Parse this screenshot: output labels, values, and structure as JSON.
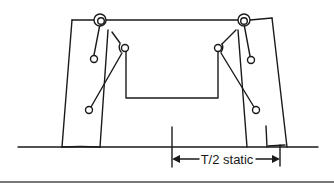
{
  "diagram": {
    "type": "suspension-linkage-schematic",
    "dimension_label": "T/2 static",
    "colors": {
      "line": "#1a1a1a",
      "background": "#ffffff",
      "bottom_rule": "#777777"
    }
  }
}
